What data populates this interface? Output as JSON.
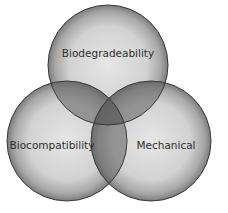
{
  "diagram": {
    "type": "venn-3",
    "background": "#ffffff",
    "circle_fill_center": "#e4e4e4",
    "circle_fill_edge": "#8e8e8e",
    "outline_color": "#3a3a3a",
    "overlap_color": "#5a5a5a",
    "sets": [
      {
        "id": "biodegradeability",
        "label": "Biodegradeability",
        "cx": 108,
        "cy": 65,
        "r": 60
      },
      {
        "id": "biocompatibility",
        "label": "Biocompatibility",
        "cx": 67,
        "cy": 141,
        "r": 60
      },
      {
        "id": "mechanical",
        "label": "Mechanical",
        "cx": 151,
        "cy": 141,
        "r": 60
      }
    ]
  }
}
